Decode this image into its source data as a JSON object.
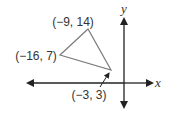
{
  "diagram": {
    "type": "coordinate-plane-triangle",
    "axes": {
      "x_label": "x",
      "y_label": "y"
    },
    "vertices": [
      {
        "label": "(−9, 14)",
        "x": -9,
        "y": 14
      },
      {
        "label": "(−16, 7)",
        "x": -16,
        "y": 7
      },
      {
        "label": "(−3, 3)",
        "x": -3,
        "y": 3
      }
    ],
    "colors": {
      "triangle_stroke": "#7a7a7a",
      "axis_stroke": "#222222",
      "text": "#333333"
    }
  }
}
